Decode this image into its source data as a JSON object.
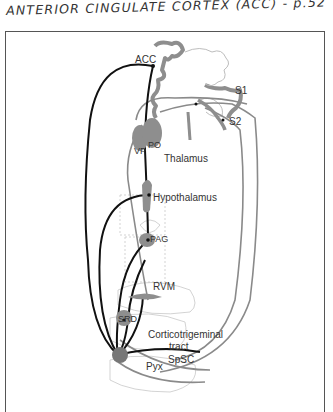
{
  "header": {
    "title": "ANTERIOR CINGULATE CORTEX (ACC) - p.52"
  },
  "diagram": {
    "labels": {
      "acc": "ACC",
      "s1": "S1",
      "s2": "S2",
      "vp": "VP",
      "po": "PO",
      "thalamus": "Thalamus",
      "hypothalamus": "Hypothalamus",
      "pag": "PAG",
      "rvm": "RVM",
      "srd": "SRD",
      "corticotrigeminal": "Corticotrigeminal",
      "tract": "tract",
      "spsc": "SpSC",
      "pyx": "Pyx"
    },
    "colors": {
      "black_pathway": "#111111",
      "gray_pathway": "#8a8a8a",
      "structure_fill": "#8e8e8e",
      "outline": "#bdbdbd"
    }
  }
}
